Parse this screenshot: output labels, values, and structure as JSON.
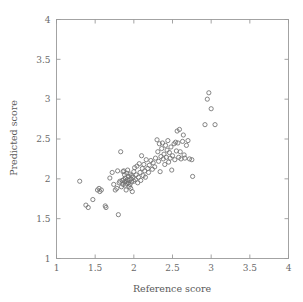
{
  "chart_data": {
    "type": "scatter",
    "title": "",
    "xlabel": "Reference score",
    "ylabel": "Predicted score",
    "xlim": [
      1,
      4
    ],
    "ylim": [
      1,
      4
    ],
    "grid": false,
    "legend": null,
    "xticks": [
      "1",
      "1.5",
      "2",
      "2.5",
      "3",
      "3.5",
      "4"
    ],
    "xtick_values": [
      1,
      1.5,
      2,
      2.5,
      3,
      3.5,
      4
    ],
    "yticks": [
      "1",
      "1.5",
      "2",
      "2.5",
      "3",
      "3.5",
      "4"
    ],
    "ytick_values": [
      1,
      1.5,
      2,
      2.5,
      3,
      3.5,
      4
    ],
    "marker": "open-circle",
    "marker_color": "#707070",
    "marker_radius_px": 2.1,
    "series": [
      {
        "name": "samples",
        "points": [
          [
            1.3,
            1.97
          ],
          [
            1.38,
            1.67
          ],
          [
            1.41,
            1.64
          ],
          [
            1.47,
            1.74
          ],
          [
            1.53,
            1.86
          ],
          [
            1.55,
            1.88
          ],
          [
            1.56,
            1.84
          ],
          [
            1.58,
            1.86
          ],
          [
            1.63,
            1.66
          ],
          [
            1.64,
            1.64
          ],
          [
            1.69,
            2.01
          ],
          [
            1.72,
            2.08
          ],
          [
            1.74,
            1.93
          ],
          [
            1.76,
            1.86
          ],
          [
            1.78,
            1.88
          ],
          [
            1.79,
            2.1
          ],
          [
            1.8,
            1.55
          ],
          [
            1.81,
            1.95
          ],
          [
            1.82,
            1.97
          ],
          [
            1.83,
            2.34
          ],
          [
            1.84,
            1.9
          ],
          [
            1.85,
            1.98
          ],
          [
            1.86,
            2.09
          ],
          [
            1.86,
            1.93
          ],
          [
            1.87,
            1.99
          ],
          [
            1.87,
            2.1
          ],
          [
            1.88,
            1.96
          ],
          [
            1.88,
            2.05
          ],
          [
            1.89,
            1.92
          ],
          [
            1.89,
            2.01
          ],
          [
            1.9,
            1.86
          ],
          [
            1.9,
            1.97
          ],
          [
            1.91,
            2.07
          ],
          [
            1.91,
            1.94
          ],
          [
            1.92,
            1.99
          ],
          [
            1.92,
            2.11
          ],
          [
            1.93,
            1.95
          ],
          [
            1.93,
            2.03
          ],
          [
            1.94,
            1.9
          ],
          [
            1.94,
            1.98
          ],
          [
            1.95,
            2.06
          ],
          [
            1.95,
            1.93
          ],
          [
            1.96,
            2.0
          ],
          [
            1.96,
            1.88
          ],
          [
            1.97,
            2.04
          ],
          [
            1.97,
            1.96
          ],
          [
            1.98,
            1.84
          ],
          [
            1.99,
            2.02
          ],
          [
            2.0,
            1.97
          ],
          [
            2.0,
            2.09
          ],
          [
            2.01,
            2.14
          ],
          [
            2.02,
            1.99
          ],
          [
            2.03,
            2.05
          ],
          [
            2.04,
            2.16
          ],
          [
            2.05,
            1.95
          ],
          [
            2.06,
            2.02
          ],
          [
            2.07,
            2.19
          ],
          [
            2.08,
            2.08
          ],
          [
            2.09,
            1.98
          ],
          [
            2.1,
            2.29
          ],
          [
            2.11,
            2.13
          ],
          [
            2.12,
            2.04
          ],
          [
            2.13,
            2.18
          ],
          [
            2.14,
            2.1
          ],
          [
            2.15,
            2.02
          ],
          [
            2.16,
            2.24
          ],
          [
            2.18,
            2.13
          ],
          [
            2.19,
            2.08
          ],
          [
            2.2,
            2.17
          ],
          [
            2.22,
            2.23
          ],
          [
            2.24,
            2.12
          ],
          [
            2.25,
            2.2
          ],
          [
            2.27,
            2.15
          ],
          [
            2.28,
            2.26
          ],
          [
            2.3,
            2.49
          ],
          [
            2.31,
            2.34
          ],
          [
            2.32,
            2.22
          ],
          [
            2.33,
            2.44
          ],
          [
            2.34,
            2.09
          ],
          [
            2.35,
            2.28
          ],
          [
            2.36,
            2.38
          ],
          [
            2.37,
            2.45
          ],
          [
            2.38,
            2.25
          ],
          [
            2.39,
            2.31
          ],
          [
            2.4,
            2.18
          ],
          [
            2.41,
            2.42
          ],
          [
            2.42,
            2.27
          ],
          [
            2.43,
            2.36
          ],
          [
            2.44,
            2.48
          ],
          [
            2.45,
            2.21
          ],
          [
            2.46,
            2.33
          ],
          [
            2.47,
            2.26
          ],
          [
            2.48,
            2.4
          ],
          [
            2.49,
            2.11
          ],
          [
            2.5,
            2.29
          ],
          [
            2.52,
            2.44
          ],
          [
            2.53,
            2.24
          ],
          [
            2.54,
            2.46
          ],
          [
            2.55,
            2.35
          ],
          [
            2.56,
            2.6
          ],
          [
            2.57,
            2.45
          ],
          [
            2.58,
            2.27
          ],
          [
            2.59,
            2.62
          ],
          [
            2.6,
            2.34
          ],
          [
            2.61,
            2.25
          ],
          [
            2.63,
            2.47
          ],
          [
            2.64,
            2.55
          ],
          [
            2.65,
            2.3
          ],
          [
            2.66,
            2.26
          ],
          [
            2.68,
            2.42
          ],
          [
            2.7,
            2.48
          ],
          [
            2.72,
            2.25
          ],
          [
            2.75,
            2.24
          ],
          [
            2.76,
            2.03
          ],
          [
            2.92,
            2.68
          ],
          [
            2.95,
            3.0
          ],
          [
            2.97,
            3.08
          ],
          [
            3.0,
            2.88
          ],
          [
            3.05,
            2.68
          ]
        ]
      }
    ]
  },
  "axes": {
    "x_title": "Reference score",
    "y_title": "Predicted score"
  }
}
